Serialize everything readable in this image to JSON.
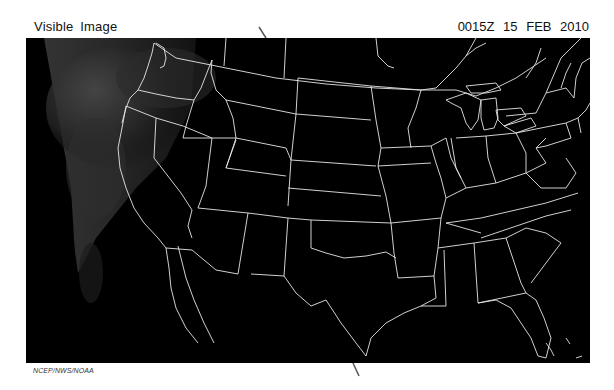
{
  "header": {
    "product_title": "Visible Image",
    "valid_time": "0015Z  15 FEB 2010"
  },
  "map": {
    "region": "Contiguous United States",
    "imagery_type": "Visible satellite",
    "background_color": "#000000",
    "border_color": "#e6e6e6",
    "cloud_region": "Pacific Northwest / West Coast (grey cloud cover on left edge)"
  },
  "footer": {
    "credit": "NCEP/NWS/NOAA"
  }
}
